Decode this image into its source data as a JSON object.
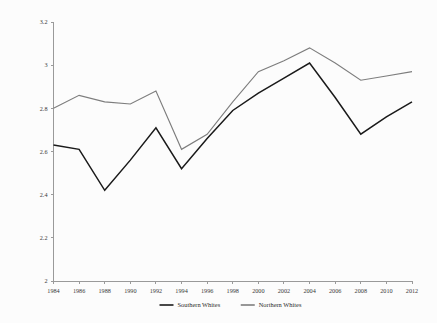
{
  "chart_data": {
    "type": "line",
    "title": "",
    "subtitle": "",
    "xlabel": "",
    "ylabel": "",
    "x": [
      1984,
      1986,
      1988,
      1990,
      1992,
      1994,
      1996,
      1998,
      2000,
      2002,
      2004,
      2006,
      2008,
      2010,
      2012
    ],
    "categories": [
      "1984",
      "1986",
      "1988",
      "1990",
      "1992",
      "1994",
      "1996",
      "1998",
      "2000",
      "2002",
      "2004",
      "2006",
      "2008",
      "2010",
      "2012"
    ],
    "xtick_labels": [
      "1984",
      "1986",
      "1988",
      "1990",
      "1992",
      "1994",
      "1996",
      "1998",
      "2000",
      "2002",
      "2004",
      "2006",
      "2008",
      "2010",
      "2012"
    ],
    "ytick_labels": [
      "2",
      "2.2",
      "2.4",
      "2.6",
      "2.8",
      "3",
      "3.2"
    ],
    "ytick_values": [
      2,
      2.2,
      2.4,
      2.6,
      2.8,
      3,
      3.2
    ],
    "xlim": [
      1984,
      2012
    ],
    "ylim": [
      2,
      3.2
    ],
    "grid": false,
    "legend_position": "bottom-center",
    "series": [
      {
        "name": "Southern Whites",
        "color": "#1a1a1a",
        "values": [
          2.63,
          2.61,
          2.42,
          2.56,
          2.71,
          2.52,
          2.66,
          2.79,
          2.87,
          2.94,
          3.01,
          2.85,
          2.68,
          2.76,
          2.83
        ]
      },
      {
        "name": "Northern Whites",
        "color": "#7d7d7d",
        "values": [
          2.8,
          2.86,
          2.83,
          2.82,
          2.88,
          2.61,
          2.68,
          2.83,
          2.97,
          3.02,
          3.08,
          3.01,
          2.93,
          2.95,
          2.97
        ]
      }
    ]
  },
  "legend": {
    "items": [
      {
        "label": "Southern Whites",
        "color": "#1a1a1a"
      },
      {
        "label": "Northern Whites",
        "color": "#7d7d7d"
      }
    ]
  },
  "colors": {
    "background": "#fcfcfc",
    "axis": "#9a9a9a",
    "southern": "#1a1a1a",
    "northern": "#7d7d7d",
    "text": "#3a3a3a"
  }
}
